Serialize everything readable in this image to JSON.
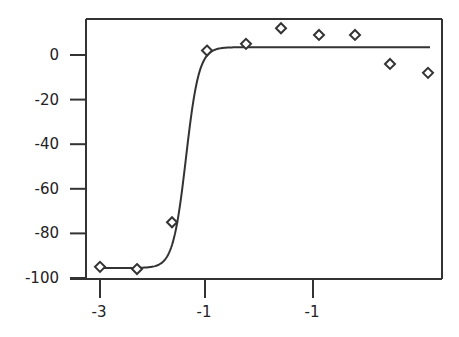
{
  "chart_data": {
    "type": "scatter",
    "title": "",
    "xlabel": "",
    "ylabel": "",
    "x_tick_labels": [
      "-3",
      "-1",
      "-1"
    ],
    "y_tick_labels": [
      "0",
      "-20",
      "-40",
      "-60",
      "-80",
      "-100"
    ],
    "y_ticks": [
      0,
      -20,
      -40,
      -60,
      -80,
      -100
    ],
    "ylim": [
      -100,
      16
    ],
    "grid": false,
    "legend": null,
    "series": [
      {
        "name": "data",
        "marker": "diamond-open",
        "x": [
          100,
          137,
          172,
          207,
          246,
          281,
          319,
          355,
          390,
          428
        ],
        "y": [
          -95,
          -96,
          -75,
          2,
          5,
          12,
          9,
          9,
          -4,
          -8
        ]
      },
      {
        "name": "fit",
        "style": "line",
        "bottom": -95.5,
        "top": 3.5,
        "midpoint_px": 186,
        "slope_px": 6.5,
        "x_start_px": 100,
        "x_end_px": 430
      }
    ]
  }
}
